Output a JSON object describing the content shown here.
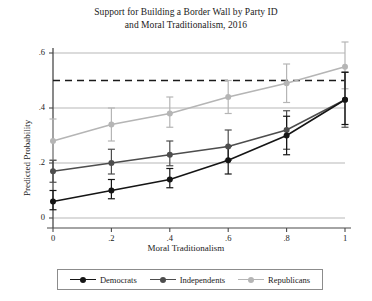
{
  "chart_data": {
    "type": "line",
    "title": "Support for Building a Border Wall by Party ID and Moral Traditionalism, 2016",
    "title_lines": [
      "Support for Building a Border Wall by Party ID",
      "and Moral Traditionalism, 2016"
    ],
    "xlabel": "Moral Traditionalism",
    "ylabel": "Predicted Probability",
    "x": [
      0,
      0.2,
      0.4,
      0.6,
      0.8,
      1
    ],
    "xticks": [
      "0",
      ".2",
      ".4",
      ".6",
      ".8",
      "1"
    ],
    "yticks": [
      "0",
      ".2",
      ".4",
      ".6"
    ],
    "ytick_values": [
      0,
      0.2,
      0.4,
      0.6
    ],
    "xlim": [
      0,
      1
    ],
    "ylim": [
      0,
      0.6
    ],
    "grid": "horizontal",
    "legend_position": "bottom",
    "reference_line": {
      "value": 0.5,
      "style": "dashed",
      "color": "#1a1a1a",
      "orientation": "horizontal"
    },
    "series": [
      {
        "name": "Democrats",
        "color": "#151515",
        "marker": "circle",
        "values": [
          0.06,
          0.1,
          0.14,
          0.21,
          0.3,
          0.43
        ],
        "ci_lower": [
          0.03,
          0.07,
          0.11,
          0.16,
          0.23,
          0.34
        ],
        "ci_upper": [
          0.1,
          0.14,
          0.18,
          0.26,
          0.37,
          0.53
        ]
      },
      {
        "name": "Independents",
        "color": "#4d4d4d",
        "marker": "circle",
        "values": [
          0.17,
          0.2,
          0.23,
          0.26,
          0.32,
          0.43
        ],
        "ci_lower": [
          0.13,
          0.16,
          0.19,
          0.21,
          0.25,
          0.33
        ],
        "ci_upper": [
          0.21,
          0.25,
          0.28,
          0.32,
          0.39,
          0.53
        ]
      },
      {
        "name": "Republicans",
        "color": "#b5b5b5",
        "marker": "circle",
        "values": [
          0.28,
          0.34,
          0.38,
          0.44,
          0.49,
          0.55
        ],
        "ci_lower": [
          0.21,
          0.28,
          0.33,
          0.38,
          0.42,
          0.47
        ],
        "ci_upper": [
          0.36,
          0.4,
          0.44,
          0.5,
          0.56,
          0.64
        ]
      }
    ]
  },
  "legend": {
    "entries": [
      {
        "label": "Democrats"
      },
      {
        "label": "Independents"
      },
      {
        "label": "Republicans"
      }
    ]
  }
}
